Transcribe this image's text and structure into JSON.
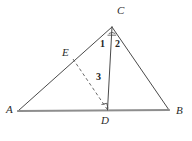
{
  "figure": {
    "name": "triangle-with-cevian-and-dashed-segment",
    "canvas": {
      "width": 192,
      "height": 141
    },
    "background_color": "#ffffff",
    "stroke_color": "#4a4a4a",
    "baseline_color": "#8e8e8e",
    "dash_color": "#5a5a5a",
    "label_color": "#2a2a2a"
  },
  "points": {
    "A": {
      "label": "A",
      "x": 18,
      "y": 111
    },
    "B": {
      "label": "B",
      "x": 169,
      "y": 110
    },
    "C": {
      "label": "C",
      "x": 112,
      "y": 27
    },
    "D": {
      "label": "D",
      "x": 107,
      "y": 110
    },
    "E": {
      "label": "E",
      "x": 73,
      "y": 59
    }
  },
  "segments": [
    {
      "name": "side-AC",
      "from": "A",
      "to": "C",
      "style": "solid"
    },
    {
      "name": "side-CB",
      "from": "C",
      "to": "B",
      "style": "solid"
    },
    {
      "name": "base-AB",
      "from": "A",
      "to": "B",
      "style": "solid-thick"
    },
    {
      "name": "cevian-CD",
      "from": "C",
      "to": "D",
      "style": "solid"
    },
    {
      "name": "segment-ED",
      "from": "E",
      "to": "D",
      "style": "dashed"
    }
  ],
  "angle_labels": {
    "one": "1",
    "two": "2",
    "three": "3"
  },
  "marks": {
    "right_angle_at_D": "right-angle-square",
    "vertex_tick_at_C": "angle-tick"
  }
}
